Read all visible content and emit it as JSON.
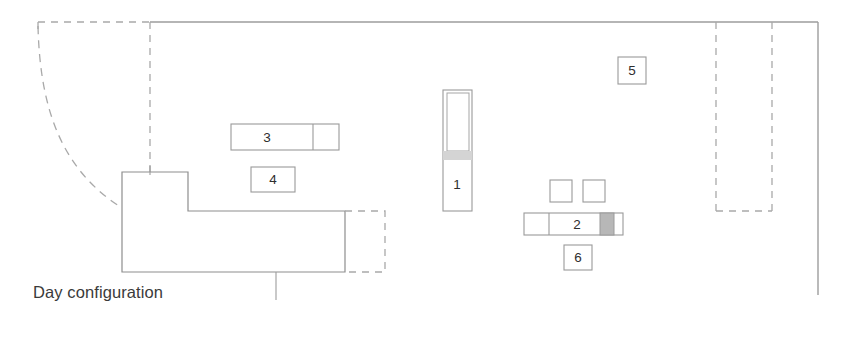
{
  "plan": {
    "caption": "Day configuration",
    "background_color": "#ffffff",
    "wall_color": "#9a9a9a",
    "furniture_color": "#8c8c8c",
    "dashed_color": "#a8a8a8",
    "fill_gray": "#b5b5b5",
    "band_gray": "#d2d2d2"
  },
  "labels": {
    "item1": "1",
    "item2": "2",
    "item3": "3",
    "item4": "4",
    "item5": "5",
    "item6": "6"
  },
  "elements": [
    {
      "id": "1",
      "name": "tall-vertical-unit",
      "label": "1"
    },
    {
      "id": "2",
      "name": "low-horizontal-unit",
      "label": "2"
    },
    {
      "id": "3",
      "name": "wide-upper-unit",
      "label": "3"
    },
    {
      "id": "4",
      "name": "sofa-callout",
      "label": "4"
    },
    {
      "id": "5",
      "name": "right-zone-callout",
      "label": "5"
    },
    {
      "id": "6",
      "name": "media-unit-callout",
      "label": "6"
    }
  ]
}
